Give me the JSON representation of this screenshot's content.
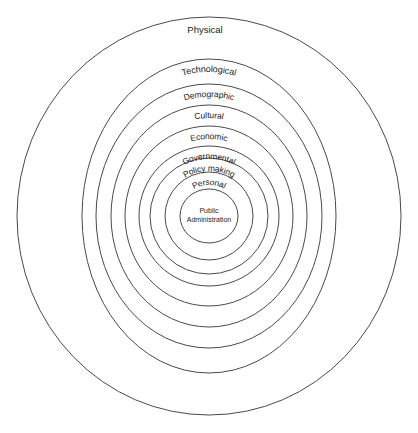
{
  "diagram": {
    "type": "concentric-circles",
    "background_color": "#ffffff",
    "stroke_color": "#4a4a4a",
    "text_color": "#1c1c1c",
    "center": {
      "x": 209,
      "y": 216
    },
    "core": {
      "label_line1": "Public",
      "label_line2": "Administration",
      "radius_x": 29,
      "radius_y": 27
    },
    "rings": [
      {
        "index": 0,
        "label": "Physical",
        "radius_x": 192,
        "radius_y": 199,
        "font_size": 9.5,
        "curve": 0
      },
      {
        "index": 1,
        "label": "Technological",
        "radius_x": 127,
        "radius_y": 157,
        "font_size": 9,
        "curve": 1
      },
      {
        "index": 2,
        "label": "Demographic",
        "radius_x": 113,
        "radius_y": 132,
        "font_size": 8.5,
        "curve": 1
      },
      {
        "index": 3,
        "label": "Cultural",
        "radius_x": 98,
        "radius_y": 111,
        "font_size": 8.5,
        "curve": 1
      },
      {
        "index": 4,
        "label": "Economic",
        "radius_x": 84,
        "radius_y": 90,
        "font_size": 8.5,
        "curve": 1
      },
      {
        "index": 5,
        "label": "Governmental",
        "radius_x": 70,
        "radius_y": 70,
        "font_size": 8.5,
        "curve": 1
      },
      {
        "index": 6,
        "label": "Policy making",
        "radius_x": 59,
        "radius_y": 58,
        "font_size": 8.5,
        "curve": 1
      },
      {
        "index": 7,
        "label": "Personal",
        "radius_x": 44,
        "radius_y": 44,
        "font_size": 8.5,
        "curve": 1
      }
    ]
  }
}
